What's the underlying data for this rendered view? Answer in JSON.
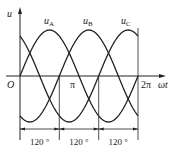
{
  "diagram": {
    "type": "three-phase-sine-waveform",
    "y_axis_label": "u",
    "x_axis_label": "ωt",
    "origin_label": "O",
    "x_ticks": [
      {
        "label": "π",
        "angle_deg": 180
      },
      {
        "label": "2π",
        "angle_deg": 360
      }
    ],
    "curves": [
      {
        "name": "uA",
        "label_main": "u",
        "label_sub": "A",
        "phase_deg": 0
      },
      {
        "name": "uB",
        "label_main": "u",
        "label_sub": "B",
        "phase_deg": -120
      },
      {
        "name": "uC",
        "label_main": "u",
        "label_sub": "C",
        "phase_deg": -240
      }
    ],
    "intervals": [
      {
        "label": "120 °"
      },
      {
        "label": "120 °"
      },
      {
        "label": "120 °"
      }
    ],
    "colors": {
      "line": "#222222",
      "background": "#ffffff"
    }
  }
}
